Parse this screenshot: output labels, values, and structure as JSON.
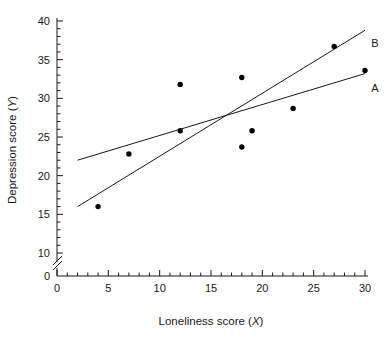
{
  "chart_data": {
    "type": "scatter",
    "title": "",
    "xlabel": "Loneliness score (X)",
    "ylabel": "Depression score (Y)",
    "xlabel_text": "Loneliness score",
    "xlabel_var": "X",
    "ylabel_text": "Depression score",
    "ylabel_var": "Y",
    "xlim": [
      0,
      30
    ],
    "ylim": [
      0,
      40
    ],
    "y_break": {
      "present": true,
      "from": 0,
      "to": 10
    },
    "grid": false,
    "legend_position": "inline-right",
    "x_ticks_major": [
      0,
      5,
      10,
      15,
      20,
      25,
      30
    ],
    "x_tick_labels": [
      "0",
      "5",
      "10",
      "15",
      "20",
      "25",
      "30"
    ],
    "x_minor_interval": 1,
    "y_ticks_major": [
      0,
      10,
      15,
      20,
      25,
      30,
      35,
      40
    ],
    "y_tick_labels": [
      "0",
      "10",
      "15",
      "20",
      "25",
      "30",
      "35",
      "40"
    ],
    "y_minor_interval": 1,
    "points": [
      {
        "x": 4,
        "y": 16.0
      },
      {
        "x": 7,
        "y": 22.8
      },
      {
        "x": 12,
        "y": 31.8
      },
      {
        "x": 12,
        "y": 25.8
      },
      {
        "x": 18,
        "y": 32.7
      },
      {
        "x": 18,
        "y": 23.7
      },
      {
        "x": 19,
        "y": 25.8
      },
      {
        "x": 23,
        "y": 28.7
      },
      {
        "x": 27,
        "y": 36.7
      },
      {
        "x": 30,
        "y": 33.6
      }
    ],
    "lines": [
      {
        "name": "A",
        "label": "A",
        "x0": 2,
        "y0": 22.0,
        "x1": 30,
        "y1": 33.2
      },
      {
        "name": "B",
        "label": "B",
        "x0": 2,
        "y0": 16.0,
        "x1": 30,
        "y1": 38.8
      }
    ],
    "annotations": [
      {
        "label": "A",
        "x": 30.6,
        "y": 31.3
      },
      {
        "label": "B",
        "x": 30.6,
        "y": 37.2
      }
    ],
    "marker": {
      "shape": "circle",
      "color": "#000000",
      "size": 4.6
    },
    "line_color": "#1a1a1a",
    "axis_color": "#1a1a1a",
    "background": "#ffffff"
  }
}
